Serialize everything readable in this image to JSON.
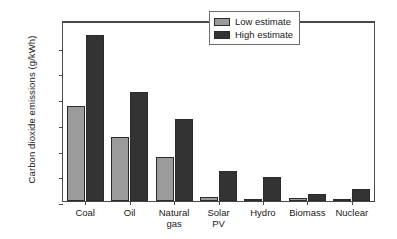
{
  "chart_data": {
    "type": "bar",
    "title": "",
    "xlabel": "",
    "ylabel": "Carbon dioxide emissions (g/kWh)",
    "categories": [
      "Coal",
      "Oil",
      "Natural gas",
      "Solar PV",
      "Hydro",
      "Biomass",
      "Nuclear"
    ],
    "category_lines": [
      [
        "Coal"
      ],
      [
        "Oil"
      ],
      [
        "Natural",
        "gas"
      ],
      [
        "Solar",
        "PV"
      ],
      [
        "Hydro"
      ],
      [
        "Biomass"
      ],
      [
        "Nuclear"
      ]
    ],
    "series": [
      {
        "name": "Low estimate",
        "color": "#9b9b9b",
        "values": [
          740,
          500,
          340,
          30,
          8,
          25,
          5
        ]
      },
      {
        "name": "High estimate",
        "color": "#333333",
        "values": [
          1290,
          850,
          640,
          230,
          190,
          55,
          95
        ]
      }
    ],
    "ylim": [
      0,
      1400
    ],
    "yticks": [
      0,
      200,
      400,
      600,
      800,
      1000,
      1200,
      1400
    ],
    "ytick_labels": [
      "0",
      "200",
      "400",
      "600",
      "800",
      "1,000",
      "1,200",
      "1,400"
    ],
    "grid": false,
    "legend_position": "top-right",
    "legend_entries": [
      "Low estimate",
      "High estimate"
    ]
  }
}
